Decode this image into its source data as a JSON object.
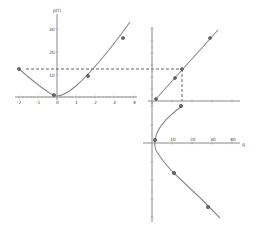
{
  "diagram": {
    "colors": {
      "axis": "#8a8a8a",
      "curve": "#8a8a8a",
      "dashed": "#555555",
      "marker": "#6a6a6a"
    },
    "top_left_plot": {
      "y_axis_label": "p(t)",
      "x_ticks": [
        "-2",
        "-1",
        "0",
        "1",
        "2",
        "3",
        "4"
      ],
      "y_ticks": [
        "10",
        "20",
        "30"
      ],
      "curve": "parabola",
      "markers": [
        {
          "x": -2,
          "y": 12.5
        },
        {
          "x": -0.2,
          "y": 1
        },
        {
          "x": 1.6,
          "y": 10
        },
        {
          "x": 3.3,
          "y": 26
        }
      ],
      "dashed_level": 12.5
    },
    "top_right_plot": {
      "y_ticks": [
        "10",
        "20",
        "30",
        "40",
        "50",
        "60"
      ],
      "x_ticks": [
        "10",
        "20",
        "30",
        "40",
        "50"
      ],
      "curve": "line",
      "markers": 4
    },
    "bottom_plot": {
      "x_ticks": [
        "10",
        "20",
        "30",
        "40"
      ],
      "x_axis_label": "q",
      "y_ticks": [
        "2",
        "1",
        "-1",
        "-2",
        "-3",
        "-4"
      ],
      "curve": "sideways parabola",
      "markers": 4
    }
  }
}
